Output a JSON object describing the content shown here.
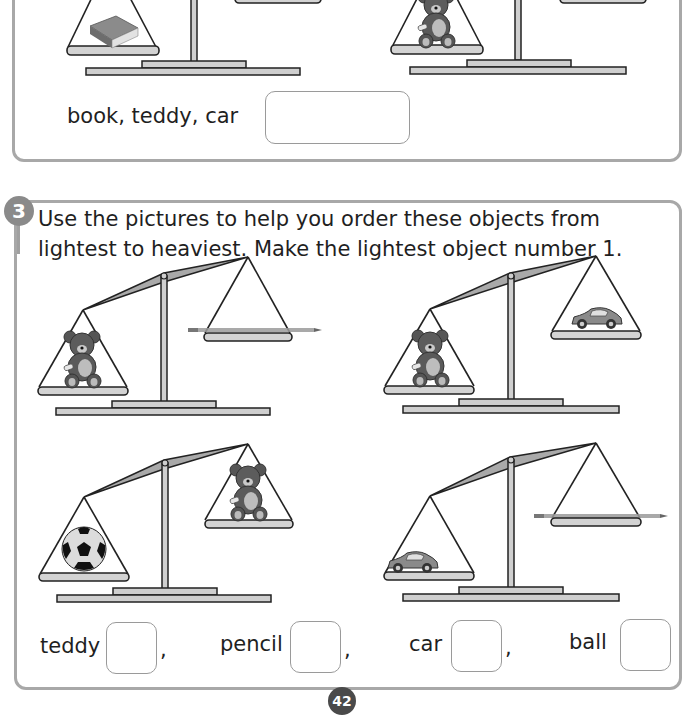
{
  "previous_question": {
    "prompt_items": "book, teddy, car",
    "scales": [
      {
        "left_pan": "book",
        "right_pan": ""
      },
      {
        "left_pan": "teddy",
        "right_pan": ""
      }
    ],
    "answer_value": ""
  },
  "question3": {
    "number": "3",
    "instruction": "Use the pictures to help you order these objects from lightest to heaviest. Make the lightest object number 1.",
    "scales": [
      {
        "left_pan": "teddy",
        "right_pan": "pencil",
        "heavier_side": "left"
      },
      {
        "left_pan": "teddy",
        "right_pan": "car",
        "heavier_side": "left"
      },
      {
        "left_pan": "ball",
        "right_pan": "teddy",
        "heavier_side": "left"
      },
      {
        "left_pan": "car",
        "right_pan": "pencil",
        "heavier_side": "left"
      }
    ],
    "answers": [
      {
        "label": "teddy",
        "value": ""
      },
      {
        "label": "pencil",
        "value": ""
      },
      {
        "label": "car",
        "value": ""
      },
      {
        "label": "ball",
        "value": ""
      }
    ],
    "separator": ","
  },
  "page_number": "42",
  "colors": {
    "frame_border": "#a8a8a8",
    "badge": "#8a8a8a",
    "scale_fill": "#cfcfcf",
    "beam_fill": "#a9a9a9",
    "page_badge": "#4a4a4a"
  }
}
